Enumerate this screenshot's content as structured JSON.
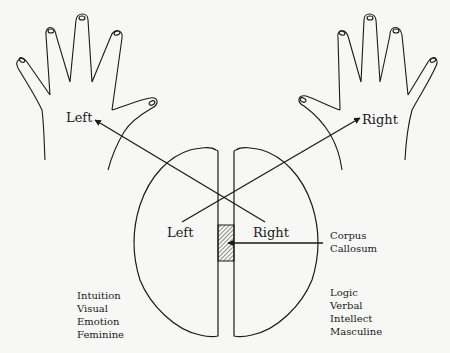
{
  "diagram": {
    "hands": {
      "left_label": "Left",
      "right_label": "Right"
    },
    "brain": {
      "left_label": "Left",
      "right_label": "Right",
      "corpus_callosum": [
        "Corpus",
        "Callosum"
      ]
    },
    "left_hemisphere_traits": [
      "Intuition",
      "Visual",
      "Emotion",
      "Feminine"
    ],
    "right_hemisphere_traits": [
      "Logic",
      "Verbal",
      "Intellect",
      "Masculine"
    ],
    "colors": {
      "ink": "#1a1a1a",
      "paper": "#f7f7f5"
    }
  }
}
